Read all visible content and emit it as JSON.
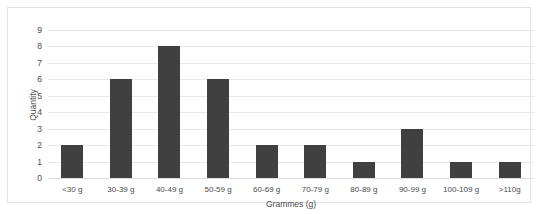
{
  "chart_data": {
    "type": "bar",
    "title": "",
    "xlabel": "Grammes (g)",
    "ylabel": "Quantity",
    "categories": [
      "<30 g",
      "30-39 g",
      "40-49 g",
      "50-59 g",
      "60-69 g",
      "70-79 g",
      "80-89 g",
      "90-99 g",
      "100-109 g",
      ">110g"
    ],
    "values": [
      2,
      6,
      8,
      6,
      2,
      2,
      1,
      3,
      1,
      1
    ],
    "ylim": [
      0,
      9
    ],
    "ytick_labels": [
      "9",
      "8",
      "7",
      "6",
      "5",
      "4",
      "3",
      "2",
      "1",
      "0"
    ],
    "ytick_values": [
      9,
      8,
      7,
      6,
      5,
      4,
      3,
      2,
      1,
      0
    ],
    "grid": true,
    "legend": false,
    "bar_color": "#404040",
    "gridline_color": "#e8e8e8",
    "background_color": "#ffffff",
    "border_color": "#e2e2e2",
    "text_color": "#4a4a4a"
  }
}
